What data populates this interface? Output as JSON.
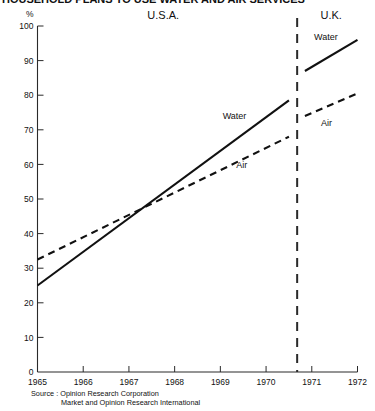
{
  "figure": {
    "title_clipped": "HOUSEHOLD PLANS TO USE WATER AND AIR SERVICES",
    "source_label": "Source :",
    "source_lines": [
      "Opinion Research Corporation",
      "Market and Opinion Research International"
    ]
  },
  "chart_data": {
    "type": "line",
    "title": "",
    "xlabel": "",
    "ylabel": "%",
    "ylim": [
      0,
      100
    ],
    "xlim": [
      1965,
      1972
    ],
    "ytick_values": [
      0,
      10,
      20,
      30,
      40,
      50,
      60,
      70,
      80,
      90,
      100
    ],
    "ytick_labels": [
      "0",
      "10",
      "20",
      "30",
      "40",
      "50",
      "60",
      "70",
      "80",
      "90",
      "100"
    ],
    "xtick_values": [
      1965,
      1966,
      1967,
      1968,
      1969,
      1970,
      1971,
      1972
    ],
    "xtick_labels": [
      "1965",
      "1966",
      "1967",
      "1968",
      "1969",
      "1970",
      "1971",
      "1972"
    ],
    "grid": false,
    "legend_position": "inline-annotations",
    "panels": [
      {
        "name": "U.S.A.",
        "label": "U.S.A.",
        "x_range": [
          1965,
          1970.5
        ],
        "series": [
          {
            "name": "Water",
            "label": "Water",
            "style": "solid",
            "x": [
              1965,
              1970.5
            ],
            "values": [
              25,
              78.5
            ]
          },
          {
            "name": "Air",
            "label": "Air",
            "style": "dashed",
            "x": [
              1965,
              1970.5
            ],
            "values": [
              32.5,
              68
            ]
          }
        ],
        "annotations": [
          {
            "text": "Water",
            "x": 1969.05,
            "y": 73
          },
          {
            "text": "Air",
            "x": 1969.35,
            "y": 59
          }
        ]
      },
      {
        "name": "U.K.",
        "label": "U.K.",
        "x_range": [
          1970.85,
          1972
        ],
        "series": [
          {
            "name": "Water",
            "label": "Water",
            "style": "solid",
            "x": [
              1970.85,
              1972
            ],
            "values": [
              87,
              96
            ]
          },
          {
            "name": "Air",
            "label": "Air",
            "style": "dashed",
            "x": [
              1970.85,
              1972
            ],
            "values": [
              74,
              80.5
            ]
          }
        ],
        "annotations": [
          {
            "text": "Water",
            "x": 1971.05,
            "y": 96
          },
          {
            "text": "Air",
            "x": 1971.2,
            "y": 71
          }
        ]
      }
    ],
    "divider": {
      "x": 1970.68,
      "style": "dashed-vertical"
    }
  }
}
